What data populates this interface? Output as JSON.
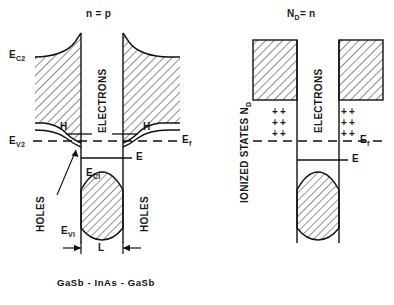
{
  "figure": {
    "caption": "GaSb - InAs - GaSb",
    "panels": [
      {
        "id": "left-panel",
        "title_main": "n",
        "title_eq": "=",
        "title_sub": "p",
        "title_full": "n = p",
        "labels": {
          "ec2": "E",
          "ec2_sub": "C2",
          "ev2": "E",
          "ev2_sub": "V2",
          "ec1": "E",
          "ec1_sub": "CI",
          "ev1": "E",
          "ev1_sub": "VI",
          "ef": "E",
          "ef_sub": "f",
          "e_level": "E",
          "electrons": "ELECTRONS",
          "holes_left": "HOLES",
          "holes_right": "HOLES",
          "h_left": "H",
          "h_right": "H",
          "width": "L"
        }
      },
      {
        "id": "right-panel",
        "title_main": "N",
        "title_sub": "D",
        "title_eq": "= n",
        "title_full": "ND = n",
        "labels": {
          "ionized_states": "IONIZED STATES N",
          "ionized_states_sub": "D",
          "electrons": "ELECTRONS",
          "ef": "E",
          "ef_sub": "f",
          "e_level": "E",
          "plus": "+"
        },
        "charge_rows_left": 3,
        "charge_rows_right": 3
      }
    ],
    "colors": {
      "line": "#111111",
      "hatch": "#333333",
      "background": "#ffffff",
      "fill": "#f2f2f2"
    }
  }
}
